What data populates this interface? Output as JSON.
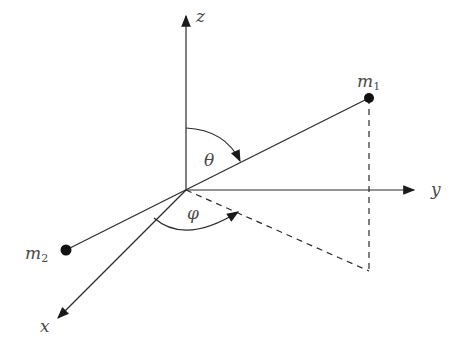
{
  "diagram": {
    "axes": {
      "x": {
        "label": "x"
      },
      "y": {
        "label": "y"
      },
      "z": {
        "label": "z"
      }
    },
    "masses": {
      "m1": {
        "base": "m",
        "sub": "1"
      },
      "m2": {
        "base": "m",
        "sub": "2"
      }
    },
    "angles": {
      "theta": {
        "label": "θ"
      },
      "phi": {
        "label": "φ"
      }
    },
    "colors": {
      "line": "#2a2a2a",
      "label": "#4a4a4a",
      "background": "#ffffff"
    }
  }
}
